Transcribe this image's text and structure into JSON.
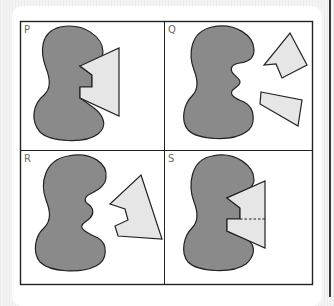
{
  "figure": {
    "colors": {
      "background": "#f0f0f0",
      "card": "#ffffff",
      "frame": "#222222",
      "blob_fill": "#8a8a8a",
      "fragment_fill": "#e6e6e6",
      "outline": "#222222",
      "label": "#6a6a6a"
    },
    "panels": [
      {
        "label": "P",
        "description": "Blob with a single notched polygon fitted into its indentation"
      },
      {
        "label": "Q",
        "description": "Blob with two separate polygon fragments placed to its right"
      },
      {
        "label": "R",
        "description": "Blob with one jagged polygon fragment placed to its right"
      },
      {
        "label": "S",
        "description": "Blob with notched polygon fitted in, with a dashed dividing line"
      }
    ]
  }
}
